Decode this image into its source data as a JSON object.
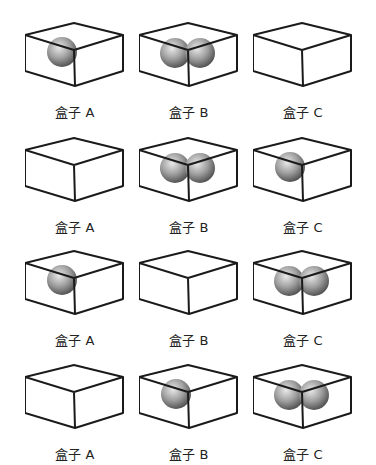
{
  "grid": {
    "rows": [
      {
        "boxes": [
          {
            "label": "盒子 A",
            "balls": 1
          },
          {
            "label": "盒子 B",
            "balls": 2
          },
          {
            "label": "盒子 C",
            "balls": 0
          }
        ]
      },
      {
        "boxes": [
          {
            "label": "盒子 A",
            "balls": 0
          },
          {
            "label": "盒子 B",
            "balls": 2
          },
          {
            "label": "盒子 C",
            "balls": 1
          }
        ]
      },
      {
        "boxes": [
          {
            "label": "盒子 A",
            "balls": 1
          },
          {
            "label": "盒子 B",
            "balls": 0
          },
          {
            "label": "盒子 C",
            "balls": 2
          }
        ]
      },
      {
        "boxes": [
          {
            "label": "盒子 A",
            "balls": 0
          },
          {
            "label": "盒子 B",
            "balls": 1
          },
          {
            "label": "盒子 C",
            "balls": 2
          }
        ]
      }
    ]
  },
  "colors": {
    "box_stroke": "#1a1a1a",
    "ball_light": "#e8e8e8",
    "ball_mid": "#a0a0a0",
    "ball_dark": "#555555",
    "label": "#222222"
  }
}
